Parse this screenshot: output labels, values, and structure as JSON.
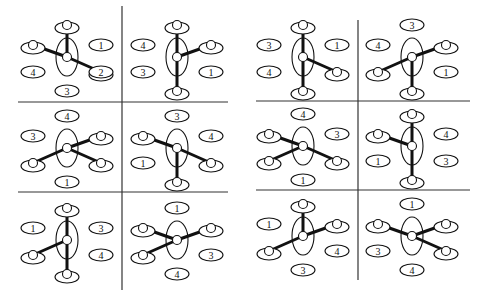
{
  "panels": [
    {
      "id": "left",
      "cells": [
        {
          "row": 0,
          "col": 0,
          "bonds": [
            "top",
            "upper-left",
            "lower-right"
          ],
          "labels": [
            {
              "slot": "upper-right",
              "text": "1"
            },
            {
              "slot": "lower-right",
              "text": "2"
            },
            {
              "slot": "bottom",
              "text": "3"
            },
            {
              "slot": "lower-left",
              "text": "4"
            }
          ]
        },
        {
          "row": 0,
          "col": 1,
          "bonds": [
            "top",
            "bottom",
            "upper-right"
          ],
          "labels": [
            {
              "slot": "upper-left",
              "text": "4"
            },
            {
              "slot": "lower-left",
              "text": "3"
            },
            {
              "slot": "lower-right",
              "text": "1"
            }
          ]
        },
        {
          "row": 1,
          "col": 0,
          "bonds": [
            "upper-right",
            "lower-left",
            "lower-right"
          ],
          "labels": [
            {
              "slot": "top",
              "text": "4"
            },
            {
              "slot": "upper-left",
              "text": "3"
            },
            {
              "slot": "bottom",
              "text": "1"
            }
          ]
        },
        {
          "row": 1,
          "col": 1,
          "bonds": [
            "upper-left",
            "lower-right",
            "bottom"
          ],
          "labels": [
            {
              "slot": "top",
              "text": "3"
            },
            {
              "slot": "upper-right",
              "text": "4"
            },
            {
              "slot": "lower-left",
              "text": "1"
            }
          ]
        },
        {
          "row": 2,
          "col": 0,
          "bonds": [
            "top",
            "bottom",
            "lower-left"
          ],
          "labels": [
            {
              "slot": "upper-left",
              "text": "1"
            },
            {
              "slot": "upper-right",
              "text": "3"
            },
            {
              "slot": "lower-right",
              "text": "4"
            }
          ]
        },
        {
          "row": 2,
          "col": 1,
          "bonds": [
            "upper-left",
            "upper-right",
            "lower-left"
          ],
          "labels": [
            {
              "slot": "top",
              "text": "1"
            },
            {
              "slot": "lower-right",
              "text": "3"
            },
            {
              "slot": "bottom",
              "text": "4"
            }
          ]
        }
      ]
    },
    {
      "id": "right",
      "cells": [
        {
          "row": 0,
          "col": 0,
          "bonds": [
            "top",
            "bottom",
            "lower-right"
          ],
          "labels": [
            {
              "slot": "upper-left",
              "text": "3"
            },
            {
              "slot": "upper-right",
              "text": "1"
            },
            {
              "slot": "lower-left",
              "text": "4"
            }
          ]
        },
        {
          "row": 0,
          "col": 1,
          "bonds": [
            "upper-right",
            "lower-left",
            "bottom"
          ],
          "labels": [
            {
              "slot": "top",
              "text": "3"
            },
            {
              "slot": "upper-left",
              "text": "4"
            },
            {
              "slot": "lower-right",
              "text": "1"
            }
          ]
        },
        {
          "row": 1,
          "col": 0,
          "bonds": [
            "upper-left",
            "lower-left",
            "lower-right"
          ],
          "labels": [
            {
              "slot": "top",
              "text": "4"
            },
            {
              "slot": "upper-right",
              "text": "3"
            },
            {
              "slot": "bottom",
              "text": "1"
            }
          ]
        },
        {
          "row": 1,
          "col": 1,
          "bonds": [
            "top",
            "bottom",
            "upper-left"
          ],
          "labels": [
            {
              "slot": "upper-right",
              "text": "4"
            },
            {
              "slot": "lower-left",
              "text": "1"
            },
            {
              "slot": "lower-right",
              "text": "3"
            }
          ]
        },
        {
          "row": 2,
          "col": 0,
          "bonds": [
            "top",
            "upper-right",
            "lower-left"
          ],
          "labels": [
            {
              "slot": "upper-left",
              "text": "1"
            },
            {
              "slot": "lower-right",
              "text": "4"
            },
            {
              "slot": "bottom",
              "text": "3"
            }
          ]
        },
        {
          "row": 2,
          "col": 1,
          "bonds": [
            "upper-left",
            "upper-right",
            "lower-right"
          ],
          "labels": [
            {
              "slot": "top",
              "text": "1"
            },
            {
              "slot": "lower-left",
              "text": "3"
            },
            {
              "slot": "bottom",
              "text": "4"
            }
          ]
        }
      ]
    }
  ]
}
